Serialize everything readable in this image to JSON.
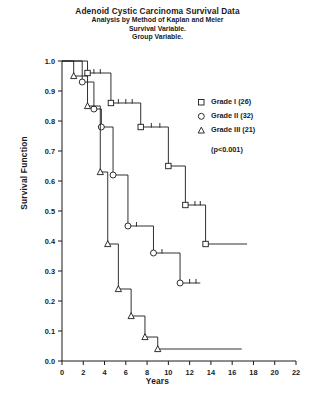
{
  "titles": {
    "main": "Adenoid Cystic Carcinoma Survival Data",
    "line2": "Analysis by Method of Kaplan and Meier",
    "line3": "Survival Variable.",
    "line4": "Group Variable."
  },
  "legend": {
    "items": [
      {
        "marker": "square-marker",
        "label": "Grade I (26)"
      },
      {
        "marker": "circle-marker",
        "label": "Grade II (32)"
      },
      {
        "marker": "triangle-marker",
        "label": "Grade III (21)"
      }
    ],
    "pvalue": "(p<0.001)"
  },
  "axes": {
    "xlabel": "Years",
    "ylabel": "Survival Function",
    "xticks": [
      "0",
      "2",
      "4",
      "6",
      "8",
      "10",
      "12",
      "14",
      "16",
      "18",
      "20",
      "22"
    ],
    "yticks": [
      "0.0",
      "0.1",
      "0.2",
      "0.3",
      "0.4",
      "0.5",
      "0.6",
      "0.7",
      "0.8",
      "0.9",
      "1.0"
    ]
  },
  "chart_data": {
    "type": "line",
    "title": "Adenoid Cystic Carcinoma Survival Data",
    "subtitle": "Analysis by Method of Kaplan and Meier",
    "xlabel": "Years",
    "ylabel": "Survival Function",
    "xlim": [
      0,
      22
    ],
    "ylim": [
      0.0,
      1.0
    ],
    "grid": false,
    "legend_position": "right",
    "annotations": [
      "(p<0.001)"
    ],
    "series": [
      {
        "name": "Grade I (26)",
        "marker": "square",
        "n": 26,
        "steps": [
          {
            "x": 0.0,
            "y": 1.0
          },
          {
            "x": 2.4,
            "y": 1.0
          },
          {
            "x": 2.4,
            "y": 0.96
          },
          {
            "x": 4.6,
            "y": 0.96
          },
          {
            "x": 4.6,
            "y": 0.86
          },
          {
            "x": 7.4,
            "y": 0.86
          },
          {
            "x": 7.4,
            "y": 0.78
          },
          {
            "x": 10.0,
            "y": 0.78
          },
          {
            "x": 10.0,
            "y": 0.65
          },
          {
            "x": 11.6,
            "y": 0.65
          },
          {
            "x": 11.6,
            "y": 0.52
          },
          {
            "x": 13.5,
            "y": 0.52
          },
          {
            "x": 13.5,
            "y": 0.39
          },
          {
            "x": 17.4,
            "y": 0.39
          }
        ],
        "censor_ticks": [
          {
            "x": 3.0,
            "y": 0.96
          },
          {
            "x": 3.6,
            "y": 0.96
          },
          {
            "x": 5.3,
            "y": 0.86
          },
          {
            "x": 6.0,
            "y": 0.86
          },
          {
            "x": 6.6,
            "y": 0.86
          },
          {
            "x": 8.4,
            "y": 0.78
          },
          {
            "x": 9.2,
            "y": 0.78
          },
          {
            "x": 12.5,
            "y": 0.52
          },
          {
            "x": 13.0,
            "y": 0.52
          }
        ]
      },
      {
        "name": "Grade II (32)",
        "marker": "circle",
        "n": 32,
        "steps": [
          {
            "x": 0.0,
            "y": 1.0
          },
          {
            "x": 1.9,
            "y": 1.0
          },
          {
            "x": 1.9,
            "y": 0.93
          },
          {
            "x": 3.0,
            "y": 0.93
          },
          {
            "x": 3.0,
            "y": 0.84
          },
          {
            "x": 3.7,
            "y": 0.84
          },
          {
            "x": 3.7,
            "y": 0.78
          },
          {
            "x": 4.8,
            "y": 0.78
          },
          {
            "x": 4.8,
            "y": 0.62
          },
          {
            "x": 6.2,
            "y": 0.62
          },
          {
            "x": 6.2,
            "y": 0.45
          },
          {
            "x": 8.6,
            "y": 0.45
          },
          {
            "x": 8.6,
            "y": 0.36
          },
          {
            "x": 11.1,
            "y": 0.36
          },
          {
            "x": 11.1,
            "y": 0.26
          },
          {
            "x": 13.0,
            "y": 0.26
          }
        ],
        "censor_ticks": [
          {
            "x": 7.0,
            "y": 0.45
          },
          {
            "x": 9.4,
            "y": 0.36
          },
          {
            "x": 12.0,
            "y": 0.26
          },
          {
            "x": 12.6,
            "y": 0.26
          }
        ]
      },
      {
        "name": "Grade III (21)",
        "marker": "triangle",
        "n": 21,
        "steps": [
          {
            "x": 0.0,
            "y": 1.0
          },
          {
            "x": 1.1,
            "y": 1.0
          },
          {
            "x": 1.1,
            "y": 0.95
          },
          {
            "x": 2.4,
            "y": 0.95
          },
          {
            "x": 2.4,
            "y": 0.85
          },
          {
            "x": 3.6,
            "y": 0.85
          },
          {
            "x": 3.6,
            "y": 0.63
          },
          {
            "x": 4.3,
            "y": 0.63
          },
          {
            "x": 4.3,
            "y": 0.39
          },
          {
            "x": 5.3,
            "y": 0.39
          },
          {
            "x": 5.3,
            "y": 0.24
          },
          {
            "x": 6.5,
            "y": 0.24
          },
          {
            "x": 6.5,
            "y": 0.15
          },
          {
            "x": 7.8,
            "y": 0.15
          },
          {
            "x": 7.8,
            "y": 0.08
          },
          {
            "x": 9.0,
            "y": 0.08
          },
          {
            "x": 9.0,
            "y": 0.04
          },
          {
            "x": 16.9,
            "y": 0.04
          }
        ],
        "censor_ticks": []
      }
    ]
  }
}
